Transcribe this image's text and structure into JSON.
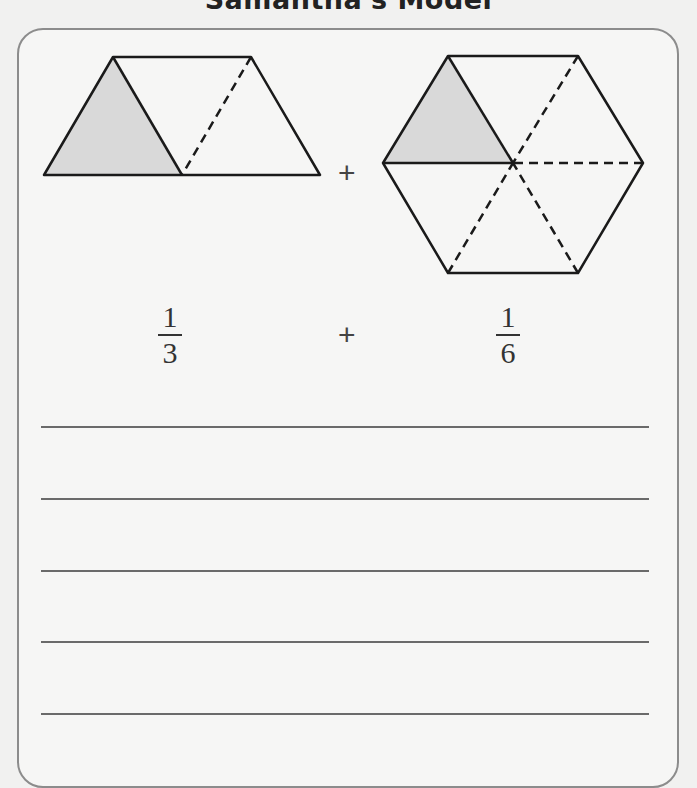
{
  "title": "Samantha's Model",
  "models": [
    {
      "shape": "trapezoid",
      "parts": 3,
      "shaded": 1
    },
    {
      "shape": "hexagon",
      "parts": 6,
      "shaded": 1
    }
  ],
  "operator_top": "+",
  "expression": {
    "left": {
      "numerator": "1",
      "denominator": "3"
    },
    "operator": "+",
    "right": {
      "numerator": "1",
      "denominator": "6"
    }
  },
  "answer_lines": 5,
  "colors": {
    "shade": "#d9d9d9",
    "stroke": "#1a1a1a",
    "border": "#8c8c8c",
    "rule": "#6a6a6a"
  }
}
